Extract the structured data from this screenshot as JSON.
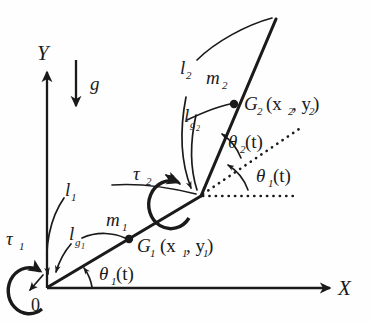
{
  "figure": {
    "background_color": "#fefefe",
    "ink_color": "#1a1a1a"
  },
  "axes": {
    "x_label": "X",
    "y_label": "Y",
    "origin_label": "0"
  },
  "gravity": {
    "label": "g"
  },
  "link1": {
    "length_label": "l",
    "length_sub": "1",
    "com_length_label": "l",
    "com_length_sub": "g",
    "com_length_sub2": "1",
    "mass_label": "m",
    "mass_sub": "1",
    "torque_label": "τ",
    "torque_sub": "1",
    "com_point_label": "G",
    "com_point_sub": "1",
    "com_coords": "(x",
    "com_coords_sub1": "1",
    "com_coords_mid": ", y",
    "com_coords_sub2": "1",
    "com_coords_end": ")",
    "angle_label": "θ",
    "angle_sub": "1",
    "angle_arg": "(t)"
  },
  "link2": {
    "length_label": "l",
    "length_sub": "2",
    "com_length_label": "l",
    "com_length_sub": "g",
    "com_length_sub2": "2",
    "mass_label": "m",
    "mass_sub": "2",
    "torque_label": "τ",
    "torque_sub": "2",
    "com_point_label": "G",
    "com_point_sub": "2",
    "com_coords": "(x",
    "com_coords_sub1": "2",
    "com_coords_mid": ", y",
    "com_coords_sub2": "2",
    "com_coords_end": ")",
    "angle_label": "θ",
    "angle_sub": "2",
    "angle_arg": "(t)"
  },
  "elbow_angle": {
    "angle_label": "θ",
    "angle_sub": "1",
    "angle_arg": "(t)"
  }
}
